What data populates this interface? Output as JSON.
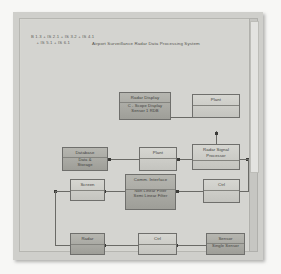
{
  "window": {
    "panel_name": "diagram-canvas",
    "scrollbar_name": "vertical-scrollbar"
  },
  "header": {
    "formula_line": "B 1.3 + IS 2.1 + IS 3.2 + IS 4.1\n    + IS 5.1 + IS 6.1",
    "title": "Airport Surveillance Radar Data Processing System"
  },
  "colors": {
    "panel": "#cfcfcb",
    "sheet": "#d4d4d0",
    "block_border": "#6f6f6c",
    "block_fill": "#c9c9c4",
    "block_fill_shaded": "#b6b6b0",
    "connector": "#6a6a66",
    "node": "#3a3a37",
    "text": "#3e3e3b"
  },
  "diagram": {
    "type": "block-diagram",
    "blocks": [
      {
        "id": "radar-display",
        "title": "Radar Display",
        "sub1": "C - Scope Display",
        "sub2": "Sensor 1 RDB",
        "shaded": true
      },
      {
        "id": "plant-top",
        "title": "Plant",
        "sub1": "",
        "sub2": "",
        "shaded": false
      },
      {
        "id": "radar-signal-processor",
        "title": "Radar Signal",
        "sub1": "Processor",
        "sub2": "",
        "shaded": false
      },
      {
        "id": "database",
        "title": "Database",
        "sub1": "Data &",
        "sub2": "Storage",
        "shaded": true
      },
      {
        "id": "plant-mid",
        "title": "Plant",
        "sub1": "",
        "sub2": "",
        "shaded": false
      },
      {
        "id": "screen",
        "title": "Screen",
        "sub1": "",
        "sub2": "",
        "shaded": false
      },
      {
        "id": "comm-interface",
        "title": "Comm. Interface",
        "sub1": "Non Linear Filter",
        "sub2": "Semi Linear Filter",
        "shaded": true
      },
      {
        "id": "ctrl-mid",
        "title": "Ctrl",
        "sub1": "",
        "sub2": "",
        "shaded": false
      },
      {
        "id": "radar",
        "title": "Radar",
        "sub1": "",
        "sub2": "",
        "shaded": true
      },
      {
        "id": "ctrl-bottom",
        "title": "Ctrl",
        "sub1": "",
        "sub2": "",
        "shaded": false
      },
      {
        "id": "sensor",
        "title": "Sensor",
        "sub1": "Single Sensor",
        "sub2": "",
        "shaded": true
      }
    ]
  }
}
